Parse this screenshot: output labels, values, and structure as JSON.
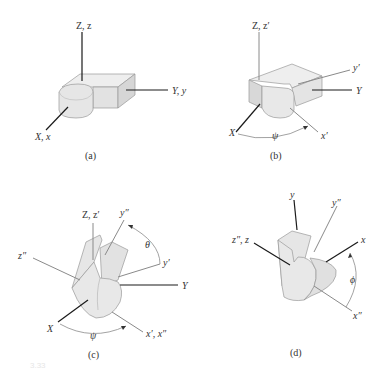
{
  "figure": {
    "footer_text": "3.33",
    "colors": {
      "axis_dark": "#1a1a1a",
      "axis_gray": "#8a8a8a",
      "body_fill": "#e8e8e8",
      "body_shade": "#cfcfcf",
      "body_edge": "#9a9a9a"
    },
    "panels": [
      {
        "caption": "(a)",
        "labels": {
          "z": "Z, z",
          "y": "Y, y",
          "x": "X, x"
        }
      },
      {
        "caption": "(b)",
        "labels": {
          "z": "Z, z′",
          "y_prime": "y′",
          "y": "Y",
          "x": "X",
          "x_prime": "x′",
          "angle": "ψ"
        }
      },
      {
        "caption": "(c)",
        "labels": {
          "z": "Z, z′",
          "y_dprime": "y″",
          "z_dprime": "z″",
          "y_prime": "y′",
          "y": "Y",
          "x": "X",
          "x_prime": "x′, x″",
          "angle_theta": "θ",
          "angle_psi": "ψ"
        }
      },
      {
        "caption": "(d)",
        "labels": {
          "y": "y",
          "y_dprime": "y″",
          "z": "z″, z",
          "x": "x",
          "x_dprime": "x″",
          "angle": "ϕ"
        }
      }
    ]
  }
}
